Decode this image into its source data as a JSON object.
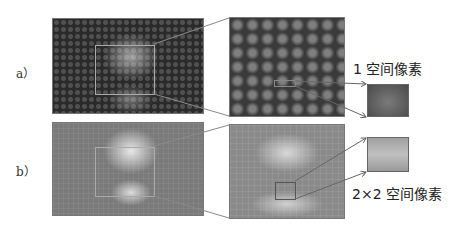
{
  "panels": [
    {
      "id": "a",
      "label": "a）",
      "caption": "1 空间像素"
    },
    {
      "id": "b",
      "label": "b）",
      "caption": "2×2 空间像素"
    }
  ],
  "colors": {
    "line": "#8a8a8a",
    "arrow": "#666666"
  }
}
